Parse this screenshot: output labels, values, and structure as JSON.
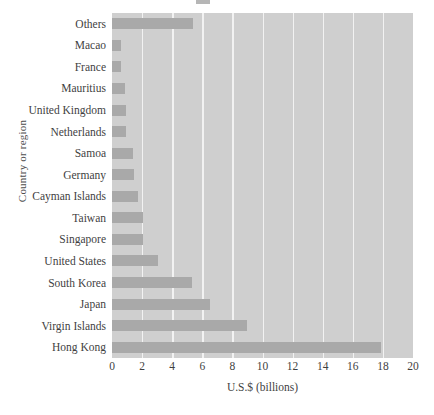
{
  "chart_data": {
    "type": "bar",
    "orientation": "horizontal",
    "title": "",
    "xlabel": "U.S.$ (billions)",
    "ylabel": "Country or region",
    "xlim": [
      0,
      20
    ],
    "xticks": [
      0,
      2,
      4,
      6,
      8,
      10,
      12,
      14,
      16,
      18,
      20
    ],
    "xtick_labels": [
      "0",
      "2",
      "4",
      "6",
      "8",
      "10",
      "12",
      "14",
      "16",
      "18",
      "20"
    ],
    "grid": "vertical",
    "legend": "none",
    "categories": [
      "Others",
      "Macao",
      "France",
      "Mauritius",
      "United Kingdom",
      "Netherlands",
      "Samoa",
      "Germany",
      "Cayman Islands",
      "Taiwan",
      "Singapore",
      "United States",
      "South Korea",
      "Japan",
      "Virgin Islands",
      "Hong Kong"
    ],
    "values": [
      5.4,
      0.6,
      0.6,
      0.85,
      0.95,
      0.95,
      1.4,
      1.45,
      1.7,
      2.05,
      2.05,
      3.05,
      5.3,
      6.5,
      9.0,
      17.9
    ]
  },
  "colors": {
    "bar": "#a9a9a9",
    "plot_background": "#cfcfcf",
    "gridline": "#f2f2f2",
    "page_background": "#ffffff",
    "text": "#3f3f3f"
  }
}
